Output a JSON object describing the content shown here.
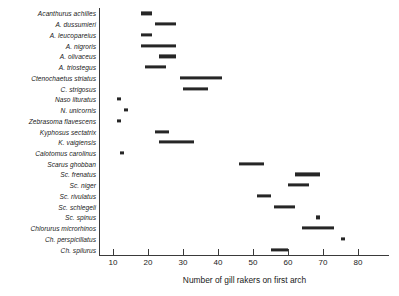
{
  "chart_data": {
    "type": "bar",
    "orientation": "horizontal-range",
    "title": "",
    "xlabel": "Number of gill rakers on first arch",
    "ylabel": "",
    "xlim": [
      5,
      88
    ],
    "ylim": [
      0,
      21
    ],
    "grid": false,
    "legend": null,
    "xticks": [
      10,
      20,
      30,
      40,
      50,
      60,
      70,
      80
    ],
    "categories": [
      "Acanthurus achilles",
      "A. dussumieri",
      "A. leucopareius",
      "A. nigroris",
      "A. olivaceus",
      "A. triostegus",
      "Ctenochaetus striatus",
      "C. strigosus",
      "Naso lituratus",
      "N. unicornis",
      "Zebrasoma flavescens",
      "Kyphosus sectatrix",
      "K. vaigiensis",
      "Calotomus carolinus",
      "Scarus ghobban",
      "Sc. frenatus",
      "Sc. niger",
      "Sc. rivulatus",
      "Sc. schlegeli",
      "Sc. spinus",
      "Chlorurus microrhinos",
      "Ch. perspicillatus",
      "Ch. spilurus"
    ],
    "ranges": [
      {
        "species": "Acanthurus achilles",
        "min": 18,
        "max": 21
      },
      {
        "species": "A. dussumieri",
        "min": 22,
        "max": 28
      },
      {
        "species": "A. leucopareius",
        "min": 18,
        "max": 21
      },
      {
        "species": "A. nigroris",
        "min": 18,
        "max": 28
      },
      {
        "species": "A. olivaceus",
        "min": 23,
        "max": 28
      },
      {
        "species": "A. triostegus",
        "min": 19,
        "max": 25
      },
      {
        "species": "Ctenochaetus striatus",
        "min": 29,
        "max": 41
      },
      {
        "species": "C. strigosus",
        "min": 30,
        "max": 37
      },
      {
        "species": "Naso lituratus",
        "min": 11,
        "max": 12
      },
      {
        "species": "N. unicornis",
        "min": 13,
        "max": 14
      },
      {
        "species": "Zebrasoma flavescens",
        "min": 11,
        "max": 12
      },
      {
        "species": "Kyphosus sectatrix",
        "min": 22,
        "max": 26
      },
      {
        "species": "K. vaigiensis",
        "min": 23,
        "max": 33
      },
      {
        "species": "Calotomus carolinus",
        "min": 12,
        "max": 13
      },
      {
        "species": "Scarus ghobban",
        "min": 46,
        "max": 53
      },
      {
        "species": "Sc. frenatus",
        "min": 62,
        "max": 69
      },
      {
        "species": "Sc. niger",
        "min": 60,
        "max": 66
      },
      {
        "species": "Sc. rivulatus",
        "min": 51,
        "max": 55
      },
      {
        "species": "Sc. schlegeli",
        "min": 56,
        "max": 62
      },
      {
        "species": "Sc. spinus",
        "min": 68,
        "max": 69
      },
      {
        "species": "Chlorurus microrhinos",
        "min": 64,
        "max": 73
      },
      {
        "species": "Ch. perspicillatus",
        "min": 75,
        "max": 76
      },
      {
        "species": "Ch. spilurus",
        "min": 55,
        "max": 60
      }
    ],
    "colors": {
      "bar": "#262626",
      "axis": "#3a3a3a",
      "text": "#1a1a1a",
      "background": "#ffffff"
    }
  }
}
